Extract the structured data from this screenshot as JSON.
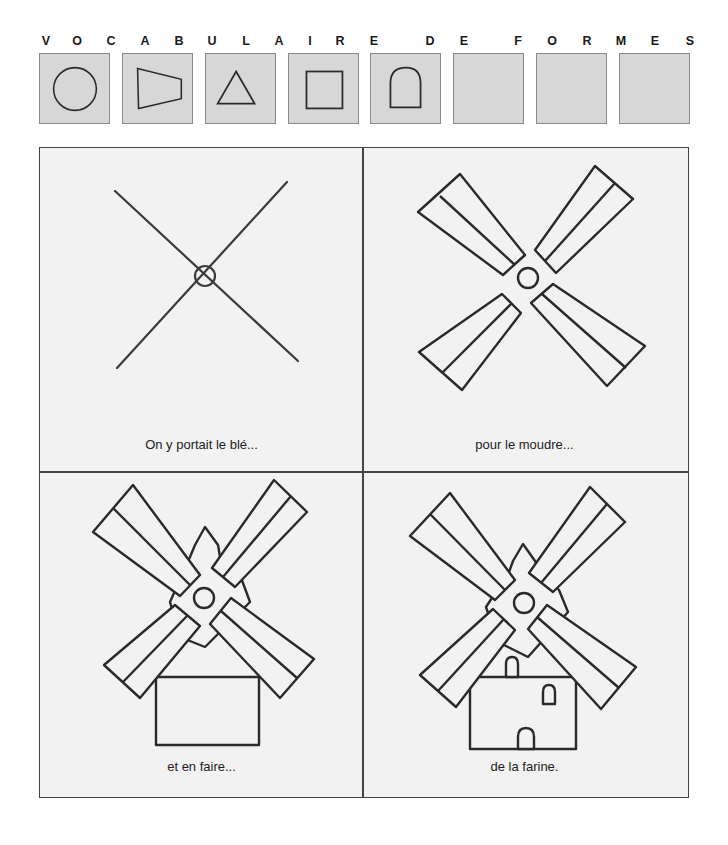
{
  "header": {
    "letters": [
      {
        "char": "V",
        "x": 46
      },
      {
        "char": "O",
        "x": 77
      },
      {
        "char": "C",
        "x": 111
      },
      {
        "char": "A",
        "x": 145
      },
      {
        "char": "B",
        "x": 179
      },
      {
        "char": "U",
        "x": 212
      },
      {
        "char": "L",
        "x": 246
      },
      {
        "char": "A",
        "x": 279
      },
      {
        "char": "I",
        "x": 310
      },
      {
        "char": "R",
        "x": 340
      },
      {
        "char": "E",
        "x": 374
      },
      {
        "char": "D",
        "x": 430
      },
      {
        "char": "E",
        "x": 464
      },
      {
        "char": "F",
        "x": 518
      },
      {
        "char": "O",
        "x": 552
      },
      {
        "char": "R",
        "x": 587
      },
      {
        "char": "M",
        "x": 621
      },
      {
        "char": "E",
        "x": 655
      },
      {
        "char": "S",
        "x": 690
      }
    ]
  },
  "shapes": [
    {
      "name": "circle",
      "label": "cercle"
    },
    {
      "name": "trapezoid",
      "label": "trapèze"
    },
    {
      "name": "triangle",
      "label": "triangle"
    },
    {
      "name": "square",
      "label": "carré"
    },
    {
      "name": "arch",
      "label": "arche"
    },
    {
      "name": "empty",
      "label": ""
    },
    {
      "name": "empty",
      "label": ""
    },
    {
      "name": "empty",
      "label": ""
    }
  ],
  "colors": {
    "box_fill": "#d7d7d7",
    "panel_fill": "#f2f2f2",
    "stroke": "#2a2a2a"
  },
  "panels": [
    {
      "step": 1,
      "caption": "On y portait le blé..."
    },
    {
      "step": 2,
      "caption": "pour le moudre..."
    },
    {
      "step": 3,
      "caption": "et en faire..."
    },
    {
      "step": 4,
      "caption": "de la farine."
    }
  ]
}
